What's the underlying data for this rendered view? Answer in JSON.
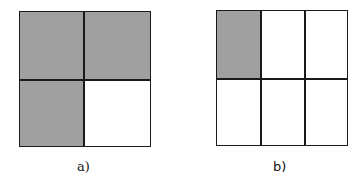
{
  "figures": [
    {
      "id": "a",
      "label": "a)",
      "rows": 2,
      "cols": 2,
      "shaded_cells": [
        [
          0,
          0
        ],
        [
          0,
          1
        ],
        [
          1,
          0
        ]
      ],
      "shaded_fraction": "3/4"
    },
    {
      "id": "b",
      "label": "b)",
      "rows": 2,
      "cols": 3,
      "shaded_cells": [
        [
          0,
          0
        ]
      ],
      "shaded_fraction": "1/6"
    }
  ],
  "colors": {
    "shade": "#a0a0a0",
    "line": "#1a1a1a",
    "background": "#ffffff"
  }
}
